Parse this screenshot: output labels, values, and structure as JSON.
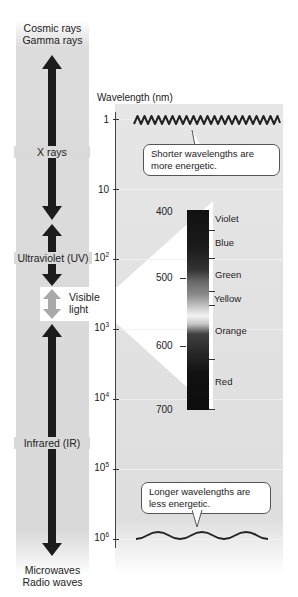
{
  "left_column": {
    "top_labels": [
      "Cosmic rays",
      "Gamma rays"
    ],
    "bands": [
      {
        "label": "X rays"
      },
      {
        "label": "Ultraviolet (UV)"
      },
      {
        "label": "Visible light"
      },
      {
        "label": "Infrared (IR)"
      }
    ],
    "visible_label_line1": "Visible",
    "visible_label_line2": "light",
    "bottom_labels": [
      "Microwaves",
      "Radio waves"
    ]
  },
  "axis": {
    "title": "Wavelength (nm)",
    "ticks": [
      {
        "base": "1",
        "exp": ""
      },
      {
        "base": "10",
        "exp": ""
      },
      {
        "base": "10",
        "exp": "2"
      },
      {
        "base": "10",
        "exp": "3"
      },
      {
        "base": "10",
        "exp": "4"
      },
      {
        "base": "10",
        "exp": "5"
      },
      {
        "base": "10",
        "exp": "6"
      }
    ]
  },
  "callouts": {
    "short": "Shorter wavelengths are more energetic.",
    "long": "Longer wavelengths are less energetic."
  },
  "visible_spectrum": {
    "ticks": [
      "400",
      "500",
      "600",
      "700"
    ],
    "colors": [
      "Violet",
      "Blue",
      "Green",
      "Yellow",
      "Orange",
      "Red"
    ]
  }
}
